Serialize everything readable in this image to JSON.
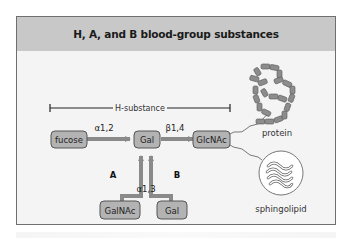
{
  "figure": {
    "title": "H, A, and B blood-group substances",
    "bracket_label": "H-substance",
    "nodes": {
      "fucose": "fucose",
      "gal_main": "Gal",
      "glcnac": "GlcNAc",
      "galnac": "GalNAc",
      "gal_b": "Gal"
    },
    "linkages": {
      "fucose_gal": "α1,2",
      "gal_glcnac": "β1,4",
      "ab_gal": "α1,3"
    },
    "branch_labels": {
      "a": "A",
      "b": "B"
    },
    "carriers": {
      "protein": "protein",
      "lipid": "sphingolipid"
    },
    "colors": {
      "header_bg": "#c8c8c8",
      "panel_bg": "#f4f4f4",
      "node_fill": "#b3b3b3",
      "arrow": "#8a8a8a",
      "text": "#1a1a1a"
    }
  }
}
